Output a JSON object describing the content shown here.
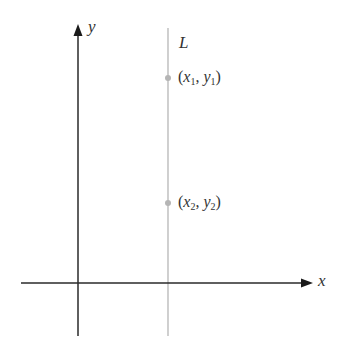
{
  "diagram": {
    "axes": {
      "x_label": "x",
      "y_label": "y"
    },
    "line": {
      "label": "L",
      "description": "vertical line",
      "color": "#bdbdbd"
    },
    "points": [
      {
        "label_x": "x",
        "label_y": "y",
        "subscript": "1",
        "color": "#b0b0b0"
      },
      {
        "label_x": "x",
        "label_y": "y",
        "subscript": "2",
        "color": "#b0b0b0"
      }
    ],
    "colors": {
      "axis": "#222222",
      "text": "#333333"
    }
  }
}
